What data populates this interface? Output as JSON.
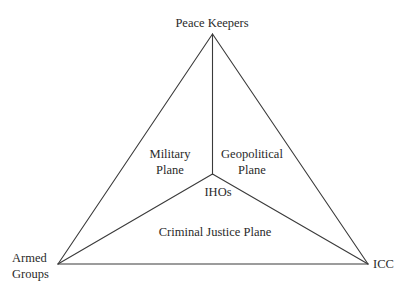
{
  "diagram": {
    "type": "triangle-plane-diagram",
    "colors": {
      "background": "#ffffff",
      "line": "#3a3a3a",
      "text": "#2a2a2a"
    },
    "vertices": {
      "top": {
        "label": "Peace Keepers"
      },
      "bottom_left": {
        "label_lines": [
          "Armed",
          "Groups"
        ]
      },
      "bottom_right": {
        "label": "ICC"
      },
      "center": {
        "label": "IHOs"
      }
    },
    "planes": {
      "military": {
        "label_lines": [
          "Military",
          "Plane"
        ]
      },
      "geopolitical": {
        "label_lines": [
          "Geopolitical",
          "Plane"
        ]
      },
      "criminal_justice": {
        "label": "Criminal Justice Plane"
      }
    },
    "edges": [
      {
        "from": "top",
        "to": "bottom_left"
      },
      {
        "from": "top",
        "to": "bottom_right"
      },
      {
        "from": "bottom_left",
        "to": "bottom_right"
      },
      {
        "from": "top",
        "to": "center"
      },
      {
        "from": "center",
        "to": "bottom_left"
      },
      {
        "from": "center",
        "to": "bottom_right"
      }
    ]
  }
}
